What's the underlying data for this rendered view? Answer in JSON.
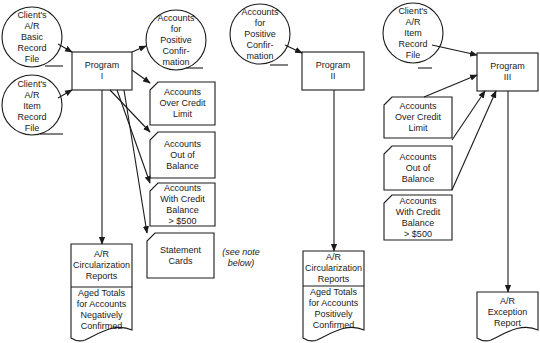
{
  "programs": {
    "p1": {
      "line1": "Program",
      "line2": "I"
    },
    "p2": {
      "line1": "Program",
      "line2": "II"
    },
    "p3": {
      "line1": "Program",
      "line2": "III"
    }
  },
  "files": {
    "basic_record_p1": [
      "Client's",
      "A/R",
      "Basic",
      "Record",
      "File"
    ],
    "item_record_p1": [
      "Client's",
      "A/R",
      "Item",
      "Record",
      "File"
    ],
    "positive_conf_out": [
      "Accounts",
      "for",
      "Positive",
      "Confir-",
      "mation"
    ],
    "positive_conf_in": [
      "Accounts",
      "for",
      "Positive",
      "Confir-",
      "mation"
    ],
    "item_record_p3": [
      "Client's",
      "A/R",
      "Item",
      "Record",
      "File"
    ]
  },
  "cards": {
    "p1_over_limit": [
      "Accounts",
      "Over Credit",
      "Limit"
    ],
    "p1_out_of_balance": [
      "Accounts",
      "Out of",
      "Balance"
    ],
    "p1_credit_balance": [
      "Accounts",
      "With Credit",
      "Balance",
      "> $500"
    ],
    "p1_statement": [
      "Statement",
      "Cards"
    ],
    "p3_over_limit": [
      "Accounts",
      "Over Credit",
      "Limit"
    ],
    "p3_out_of_balance": [
      "Accounts",
      "Out of",
      "Balance"
    ],
    "p3_credit_balance": [
      "Accounts",
      "With Credit",
      "Balance",
      "> $500"
    ]
  },
  "documents": {
    "neg_report": {
      "top": [
        "A/R",
        "Circularization",
        "Reports"
      ],
      "bottom": [
        "Aged Totals",
        "for Accounts",
        "Negatively",
        "Confirmed"
      ]
    },
    "pos_report": {
      "top": [
        "A/R",
        "Circularization",
        "Reports"
      ],
      "bottom": [
        "Aged Totals",
        "for Accounts",
        "Positively",
        "Confirmed"
      ]
    },
    "exception_report": {
      "top": [
        "A/R",
        "Exception",
        "Report"
      ]
    }
  },
  "note": {
    "line1": "(see note",
    "line2": "below)"
  },
  "colors": {
    "ink": "#1a1a1a",
    "background": "#ffffff"
  }
}
